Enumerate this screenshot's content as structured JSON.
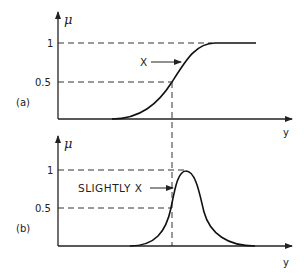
{
  "figure": {
    "panel_a": {
      "label": "(a)",
      "y_axis_label": "μ",
      "x_axis_label": "y",
      "ticks": [
        "1",
        "0.5"
      ],
      "curve_label": "X",
      "curve_type": "S-shaped increasing membership function"
    },
    "panel_b": {
      "label": "(b)",
      "y_axis_label": "μ",
      "x_axis_label": "y",
      "ticks": [
        "1",
        "0.5"
      ],
      "curve_label": "SLIGHTLY X",
      "curve_type": "bell-shaped membership function"
    }
  },
  "colors": {
    "ink": "#222222",
    "background": "#ffffff"
  }
}
